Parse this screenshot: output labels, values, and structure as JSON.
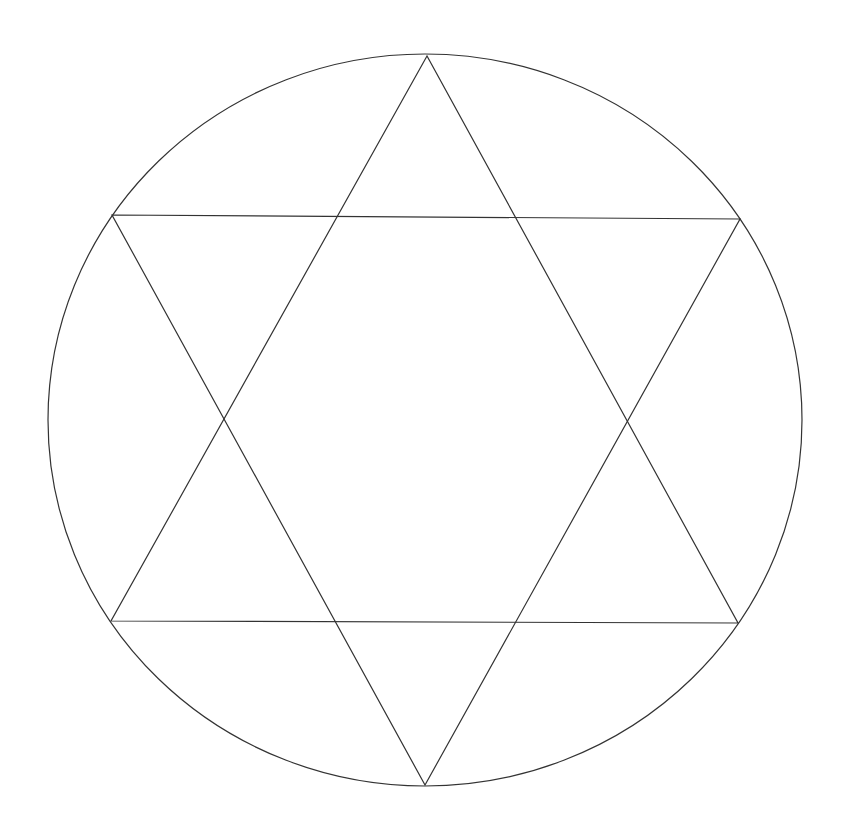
{
  "diagram": {
    "stroke_color": "#333333",
    "background_color": "#ffffff",
    "circle": {
      "cx": 425,
      "cy": 420,
      "rx": 377,
      "ry": 366
    },
    "triangles": [
      {
        "name": "upward-triangle",
        "points": [
          [
            427,
            56
          ],
          [
            111,
            621
          ],
          [
            738,
            623
          ]
        ]
      },
      {
        "name": "downward-triangle",
        "points": [
          [
            112,
            215
          ],
          [
            740,
            219
          ],
          [
            425,
            785
          ]
        ]
      }
    ]
  }
}
